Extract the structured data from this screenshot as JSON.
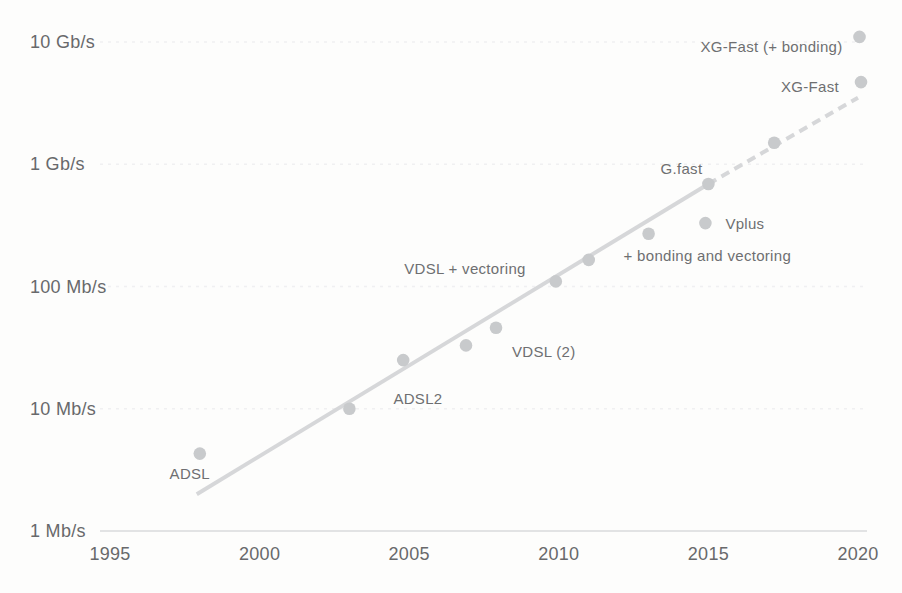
{
  "chart_data": {
    "type": "scatter",
    "title": "",
    "xlabel": "",
    "ylabel": "",
    "x_range": [
      1995,
      2020
    ],
    "y_range_mbps": [
      1,
      10000
    ],
    "y_scale": "log10",
    "grid": "faint horizontal gridlines at each decade",
    "legend": "none",
    "x_ticks": [
      "1995",
      "2000",
      "2005",
      "2010",
      "2015",
      "2020"
    ],
    "y_ticks": [
      {
        "label": "10 Gb/s",
        "mbps": 10000
      },
      {
        "label": "1 Gb/s",
        "mbps": 1000
      },
      {
        "label": "100 Mb/s",
        "mbps": 100
      },
      {
        "label": "10 Mb/s",
        "mbps": 10
      },
      {
        "label": "1 Mb/s",
        "mbps": 1
      }
    ],
    "points": [
      {
        "id": "adsl",
        "label": "ADSL",
        "year": 1998.0,
        "mbps": 4.3,
        "anchor": "middle",
        "dx": -10,
        "dy": 20
      },
      {
        "id": "adsl2",
        "label": "ADSL2",
        "year": 2003.0,
        "mbps": 10,
        "anchor": "start",
        "dx": 44,
        "dy": -10
      },
      {
        "id": "adsl2plus",
        "label": "",
        "year": 2004.8,
        "mbps": 25
      },
      {
        "id": "vdsl",
        "label": "",
        "year": 2006.9,
        "mbps": 33
      },
      {
        "id": "vdsl2",
        "label": "VDSL (2)",
        "year": 2007.9,
        "mbps": 46,
        "anchor": "start",
        "dx": 16,
        "dy": 24
      },
      {
        "id": "vdsl2-100",
        "label": "",
        "year": 2009.9,
        "mbps": 110
      },
      {
        "id": "vdsl-vectoring",
        "label": "VDSL + vectoring",
        "year": 2011.0,
        "mbps": 165,
        "anchor": "end",
        "dx": -63,
        "dy": 9
      },
      {
        "id": "bonding-vectoring",
        "label": "+ bonding and vectoring",
        "year": 2013.0,
        "mbps": 270,
        "anchor": "start",
        "dx": -25,
        "dy": 22
      },
      {
        "id": "vplus",
        "label": "Vplus",
        "year": 2014.9,
        "mbps": 330,
        "anchor": "start",
        "dx": 20,
        "dy": 1
      },
      {
        "id": "gfast",
        "label": "G.fast",
        "year": 2015.0,
        "mbps": 690,
        "anchor": "end",
        "dx": -6,
        "dy": -15
      },
      {
        "id": "xgfast-trial",
        "label": "",
        "year": 2017.2,
        "mbps": 1500
      },
      {
        "id": "xgfast",
        "label": "XG-Fast",
        "year": 2020.1,
        "mbps": 4700,
        "anchor": "end",
        "dx": -22,
        "dy": 5
      },
      {
        "id": "xgfast-bonding",
        "label": "XG-Fast (+ bonding)",
        "year": 2020.05,
        "mbps": 11000,
        "anchor": "end",
        "dx": -17,
        "dy": 10
      }
    ],
    "trend_line": {
      "solid": {
        "from": {
          "year": 1997.9,
          "mbps": 2.0
        },
        "to": {
          "year": 2015.0,
          "mbps": 690
        }
      },
      "dashed": {
        "from": {
          "year": 2015.0,
          "mbps": 690
        },
        "to": {
          "year": 2020.0,
          "mbps": 3500
        }
      }
    }
  },
  "colors": {
    "background": "#fdfdfc",
    "dot": "#c8cacc",
    "trend_line": "#d6d7d9",
    "point_label": "#6e6f71",
    "tick_label": "#68696b",
    "axis_line": "#e2e3e4",
    "gridline": "#f0f0f1"
  }
}
